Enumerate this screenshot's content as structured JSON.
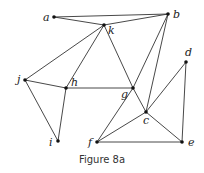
{
  "caption": "Figure 8a",
  "nodes": [
    {
      "id": "a",
      "x": 54,
      "y": 17,
      "lx": -11,
      "ly": 4
    },
    {
      "id": "b",
      "x": 168,
      "y": 14,
      "lx": 5,
      "ly": 4
    },
    {
      "id": "k",
      "x": 104,
      "y": 25,
      "lx": 4,
      "ly": 9
    },
    {
      "id": "j",
      "x": 25,
      "y": 80,
      "lx": -8,
      "ly": 3
    },
    {
      "id": "h",
      "x": 66,
      "y": 88,
      "lx": 5,
      "ly": -2
    },
    {
      "id": "g",
      "x": 133,
      "y": 88,
      "lx": -12,
      "ly": 10
    },
    {
      "id": "d",
      "x": 186,
      "y": 62,
      "lx": -1,
      "ly": -6
    },
    {
      "id": "c",
      "x": 146,
      "y": 112,
      "lx": -3,
      "ly": 12
    },
    {
      "id": "i",
      "x": 58,
      "y": 141,
      "lx": -9,
      "ly": 5
    },
    {
      "id": "f",
      "x": 97,
      "y": 142,
      "lx": -9,
      "ly": 4
    },
    {
      "id": "e",
      "x": 182,
      "y": 142,
      "lx": 6,
      "ly": 4
    }
  ],
  "edges": [
    [
      "a",
      "b"
    ],
    [
      "a",
      "k"
    ],
    [
      "k",
      "b"
    ],
    [
      "k",
      "j"
    ],
    [
      "k",
      "h"
    ],
    [
      "k",
      "g"
    ],
    [
      "j",
      "h"
    ],
    [
      "j",
      "i"
    ],
    [
      "h",
      "i"
    ],
    [
      "h",
      "g"
    ],
    [
      "g",
      "c"
    ],
    [
      "b",
      "g"
    ],
    [
      "g",
      "f"
    ],
    [
      "b",
      "c"
    ],
    [
      "d",
      "c"
    ],
    [
      "d",
      "e"
    ],
    [
      "c",
      "e"
    ],
    [
      "c",
      "f"
    ],
    [
      "f",
      "e"
    ]
  ]
}
